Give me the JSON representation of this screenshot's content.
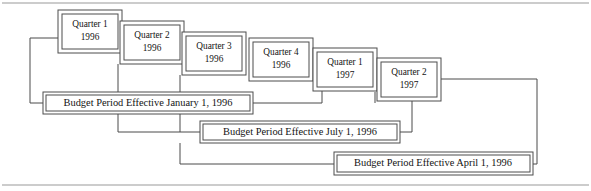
{
  "figure": {
    "background_color": "#ffffff",
    "line_color": "#4d4d4d",
    "rule_color": "#9a9a9a",
    "text_color": "#131313"
  },
  "rules": {
    "top_rule_y": 3,
    "bottom_rule_y": 185
  },
  "quarters": [
    {
      "id": "q1-1996",
      "line1": "Quarter 1",
      "line2": "1996",
      "x": 58,
      "y": 10,
      "w": 64,
      "h": 43
    },
    {
      "id": "q2-1996",
      "line1": "Quarter 2",
      "line2": "1996",
      "x": 120,
      "y": 21,
      "w": 64,
      "h": 43
    },
    {
      "id": "q3-1996",
      "line1": "Quarter 3",
      "line2": "1996",
      "x": 182,
      "y": 32,
      "w": 64,
      "h": 43
    },
    {
      "id": "q4-1996",
      "line1": "Quarter 4",
      "line2": "1996",
      "x": 249,
      "y": 38,
      "w": 64,
      "h": 43
    },
    {
      "id": "q1-1997",
      "line1": "Quarter 1",
      "line2": "1997",
      "x": 313,
      "y": 48,
      "w": 64,
      "h": 43
    },
    {
      "id": "q2-1997",
      "line1": "Quarter 2",
      "line2": "1997",
      "x": 377,
      "y": 58,
      "w": 64,
      "h": 43
    }
  ],
  "periods": [
    {
      "id": "period-january",
      "label": "Budget Period Effective January 1, 1996",
      "x": 43,
      "y": 92,
      "w": 210,
      "h": 22
    },
    {
      "id": "period-july",
      "label": "Budget Period Effective July 1, 1996",
      "x": 200,
      "y": 121,
      "w": 200,
      "h": 22
    },
    {
      "id": "period-april",
      "label": "Budget Period Effective April 1, 1996",
      "x": 334,
      "y": 152,
      "w": 199,
      "h": 23
    }
  ],
  "connectors": {
    "january": {
      "left_path": "M58,38 L30,38 L30,103 L43,103",
      "stubs": [
        "M118,64 L118,92",
        "M180,75 L180,92",
        "M253,103 L322,103 L322,81",
        "M375,103 L375,91"
      ]
    },
    "july": {
      "left_path": "M118,114 L118,132 L200,132",
      "stubs": [
        "M180,114 L180,132",
        "M400,132 L412,132 L412,101"
      ]
    },
    "april": {
      "left_path": "M180,143 L180,164 L334,164",
      "stubs": [
        "M441,79 L537,79 L537,164 L533,164"
      ]
    }
  }
}
